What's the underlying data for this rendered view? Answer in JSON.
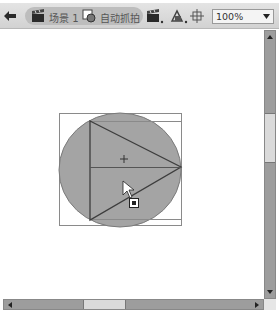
{
  "editbar": {
    "back_icon": "back-arrow-icon",
    "breadcrumb": [
      {
        "icon": "scene-clapboard-icon",
        "label": "场景 1"
      },
      {
        "icon": "graphic-symbol-icon",
        "label": "自动抓拍"
      }
    ],
    "tools": [
      {
        "name": "edit-scene-button",
        "icon": "clapboard-dropdown-icon"
      },
      {
        "name": "edit-symbols-button",
        "icon": "shapes-dropdown-icon"
      },
      {
        "name": "center-stage-button",
        "icon": "crosshair-icon"
      }
    ],
    "zoom": {
      "value": "100%",
      "dropdown_icon": "triangle-down-icon"
    }
  },
  "stage": {
    "background": "#ffffff",
    "shapes": {
      "circle_fill": "#a4a4a4",
      "stroke": "#3d3d3d",
      "bounding_box_color": "#8a8a8a"
    },
    "cursor": "selection-arrow-with-move-icon"
  },
  "scrollbars": {
    "vertical": {
      "up_icon": "scroll-up-icon",
      "down_icon": "scroll-down-icon"
    },
    "horizontal": {
      "left_icon": "scroll-left-icon",
      "right_icon": "scroll-right-icon"
    }
  }
}
